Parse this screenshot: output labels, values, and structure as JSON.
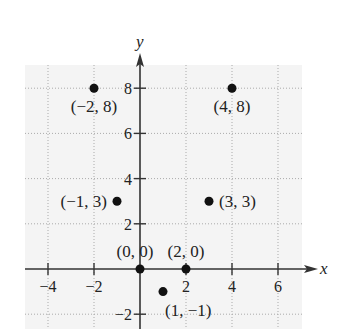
{
  "chart_data": {
    "type": "scatter",
    "title": "",
    "xlabel": "x",
    "ylabel": "y",
    "xlim": [
      -5,
      7
    ],
    "ylim": [
      -2.6,
      8.8
    ],
    "grid": true,
    "grid_step": 2,
    "legend": null,
    "x_ticks": [
      -4,
      -2,
      2,
      4,
      6
    ],
    "x_tick_labels": [
      "−4",
      "−2",
      "2",
      "4",
      "6"
    ],
    "y_ticks": [
      -2,
      2,
      4,
      6,
      8
    ],
    "y_tick_labels": [
      "−2",
      "2",
      "4",
      "6",
      "8"
    ],
    "points": [
      {
        "x": -2,
        "y": 8,
        "label": "(−2, 8)"
      },
      {
        "x": 4,
        "y": 8,
        "label": "(4, 8)"
      },
      {
        "x": -1,
        "y": 3,
        "label": "(−1, 3)"
      },
      {
        "x": 3,
        "y": 3,
        "label": "(3, 3)"
      },
      {
        "x": 0,
        "y": 0,
        "label": "(0, 0)"
      },
      {
        "x": 2,
        "y": 0,
        "label": "(2, 0)"
      },
      {
        "x": 1,
        "y": -1,
        "label": "(1, −1)"
      }
    ]
  },
  "colors": {
    "grid_background": "#f4f4f4",
    "grid_line": "#aaaaaa",
    "axis": "#333333",
    "point": "#111111"
  }
}
